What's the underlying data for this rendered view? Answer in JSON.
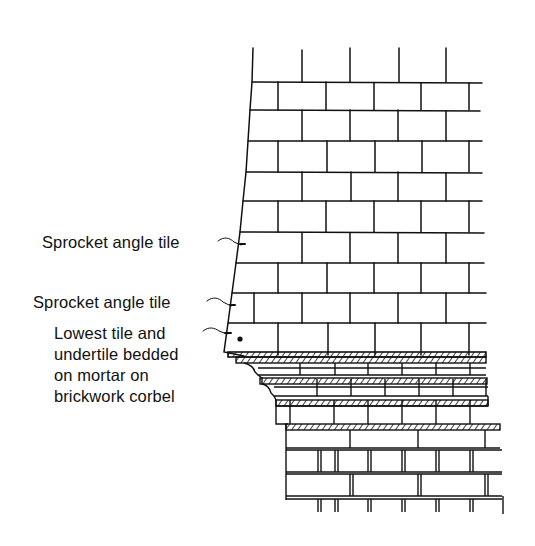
{
  "figure": {
    "type": "technical-drawing",
    "line_color": "#111111",
    "background_color": "#ffffff"
  },
  "labels": [
    {
      "text": "Sprocket angle tile"
    },
    {
      "text": "Sprocket angle tile"
    },
    {
      "text": "Lowest tile and\nundertile bedded\non mortar on\nbrickwork corbel"
    }
  ]
}
